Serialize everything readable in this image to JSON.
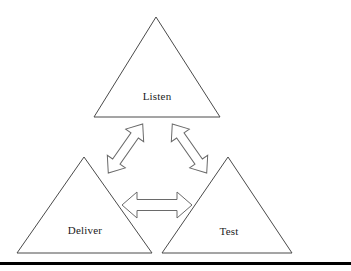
{
  "diagram": {
    "type": "triangle-cycle-diagram",
    "background_color": "#ffffff",
    "outline_color": "#4a4a4a",
    "arrow_outline_color": "#6a6a6a",
    "text_color": "#1b1b1b",
    "nodes": [
      {
        "id": "listen",
        "label": "Listen",
        "shape": "triangle",
        "position": "top",
        "apex": {
          "x": 156,
          "y": 17
        },
        "base_left": {
          "x": 94,
          "y": 117
        },
        "base_right": {
          "x": 220,
          "y": 117
        },
        "label_x": 157,
        "label_y": 96
      },
      {
        "id": "deliver",
        "label": "Deliver",
        "shape": "triangle",
        "position": "bottom-left",
        "apex": {
          "x": 84,
          "y": 157
        },
        "base_left": {
          "x": 17,
          "y": 253
        },
        "base_right": {
          "x": 152,
          "y": 253
        },
        "label_x": 85,
        "label_y": 230
      },
      {
        "id": "test",
        "label": "Test",
        "shape": "triangle",
        "position": "bottom-right",
        "apex": {
          "x": 228,
          "y": 157
        },
        "base_left": {
          "x": 162,
          "y": 253
        },
        "base_right": {
          "x": 292,
          "y": 253
        },
        "label_x": 229,
        "label_y": 231
      }
    ],
    "connectors": [
      {
        "id": "listen-deliver",
        "from": "listen",
        "to": "deliver",
        "style": "double-headed-outline-arrow",
        "orientation": "diagonal-down-left"
      },
      {
        "id": "listen-test",
        "from": "listen",
        "to": "test",
        "style": "double-headed-outline-arrow",
        "orientation": "diagonal-down-right"
      },
      {
        "id": "deliver-test",
        "from": "deliver",
        "to": "test",
        "style": "double-headed-outline-arrow",
        "orientation": "horizontal"
      }
    ],
    "rule": {
      "id": "bottom-rule",
      "color": "#000000",
      "y": 262,
      "thickness": 3
    }
  }
}
